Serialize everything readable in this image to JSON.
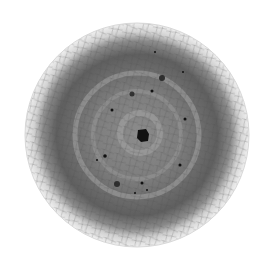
{
  "image": {
    "subject": "crackled glaze disc, top-down grayscale view",
    "background": "#ffffff",
    "disc": {
      "cx": 137,
      "cy": 135,
      "r": 112,
      "rim_color": "#e6e6e6",
      "inner_color": "#6e6e6e",
      "center_color": "#8a8a8a"
    },
    "rings": [
      {
        "r": 62,
        "color": "#a6a6a6",
        "width": 5
      },
      {
        "r": 44,
        "color": "#9c9c9c",
        "width": 4
      },
      {
        "r": 20,
        "color": "#a8a8a8",
        "width": 6
      }
    ],
    "spots": [
      {
        "x": 143,
        "y": 135,
        "r": 6
      },
      {
        "x": 162,
        "y": 78,
        "r": 3
      },
      {
        "x": 132,
        "y": 94,
        "r": 2.5
      },
      {
        "x": 152,
        "y": 91,
        "r": 1.5
      },
      {
        "x": 112,
        "y": 110,
        "r": 1.5
      },
      {
        "x": 185,
        "y": 119,
        "r": 1.5
      },
      {
        "x": 105,
        "y": 156,
        "r": 1.8
      },
      {
        "x": 180,
        "y": 165,
        "r": 1.5
      },
      {
        "x": 142,
        "y": 183,
        "r": 1.5
      },
      {
        "x": 117,
        "y": 184,
        "r": 3
      },
      {
        "x": 97,
        "y": 160,
        "r": 1
      },
      {
        "x": 135,
        "y": 193,
        "r": 1
      },
      {
        "x": 147,
        "y": 190,
        "r": 1
      },
      {
        "x": 183,
        "y": 72,
        "r": 1
      },
      {
        "x": 155,
        "y": 52,
        "r": 1
      }
    ]
  }
}
